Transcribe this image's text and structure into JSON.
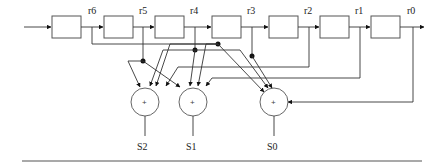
{
  "diagram": {
    "type": "shift-register syndrome calculator",
    "registers": [
      "r6",
      "r5",
      "r4",
      "r3",
      "r2",
      "r1",
      "r0"
    ],
    "register_count": 7,
    "adders": [
      {
        "id": "S2",
        "label": "S2",
        "symbol": "+"
      },
      {
        "id": "S1",
        "label": "S1",
        "symbol": "+"
      },
      {
        "id": "S0",
        "label": "S0",
        "symbol": "+"
      }
    ],
    "labels": {
      "r6": "r6",
      "r5": "r5",
      "r4": "r4",
      "r3": "r3",
      "r2": "r2",
      "r1": "r1",
      "r0": "r0",
      "s2": "S2",
      "s1": "S1",
      "s0": "S0",
      "plus": "+"
    }
  }
}
